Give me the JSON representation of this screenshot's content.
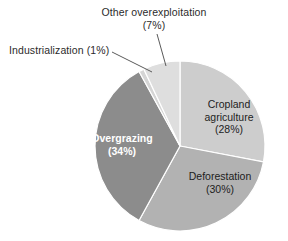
{
  "chart_data": {
    "type": "pie",
    "title": "",
    "categories": [
      "Cropland agriculture",
      "Deforestation",
      "Overgrazing",
      "Industrialization",
      "Other overexploitation"
    ],
    "values": [
      28,
      30,
      34,
      1,
      7
    ],
    "unit": "%",
    "legend": "none",
    "start_angle_deg": 0,
    "direction": "clockwise",
    "slices": [
      {
        "name": "Cropland agriculture",
        "label_line1": "Cropland",
        "label_line2": "agriculture",
        "label_pct": "(28%)",
        "value": 28,
        "color": "#cdcdcd",
        "label_placement": "inside",
        "label_color": "#1d1d1d"
      },
      {
        "name": "Deforestation",
        "label_line1": "Deforestation",
        "label_pct": "(30%)",
        "value": 30,
        "color": "#b2b2b2",
        "label_placement": "inside",
        "label_color": "#1d1d1d"
      },
      {
        "name": "Overgrazing",
        "label_line1": "Overgrazing",
        "label_pct": "(34%)",
        "value": 34,
        "color": "#8c8c8c",
        "label_placement": "inside",
        "label_color": "#ffffff",
        "label_bold": true
      },
      {
        "name": "Industrialization",
        "label_line1": "Industrialization (1%)",
        "label_pct": "",
        "value": 1,
        "color": "#d5d5d5",
        "label_placement": "outside-left",
        "label_color": "#2b2b2b"
      },
      {
        "name": "Other overexploitation",
        "label_line1": "Other overexploitation",
        "label_pct": "(7%)",
        "value": 7,
        "color": "#dedede",
        "label_placement": "outside-top",
        "label_color": "#2b2b2b"
      }
    ],
    "stroke_color": "#ffffff",
    "leader_line_color": "#5a5a5a"
  },
  "labels": {
    "other_overexploitation_name": "Other overexploitation",
    "other_overexploitation_pct": "(7%)",
    "industrialization_full": "Industrialization (1%)",
    "cropland_line1": "Cropland",
    "cropland_line2": "agriculture",
    "cropland_pct": "(28%)",
    "deforestation_name": "Deforestation",
    "deforestation_pct": "(30%)",
    "overgrazing_name": "Overgrazing",
    "overgrazing_pct": "(34%)"
  }
}
